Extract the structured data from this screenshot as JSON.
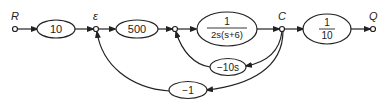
{
  "diagram": {
    "type": "signal-flow graph",
    "nodes": {
      "input": {
        "label": "R"
      },
      "error": {
        "label": "ε"
      },
      "output_c": {
        "label": "C"
      },
      "output_q": {
        "label": "Q"
      }
    },
    "blocks": {
      "gain1": {
        "label": "10"
      },
      "gain2": {
        "label": "500"
      },
      "plant": {
        "numerator": "1",
        "denominator": "2s(s+6)"
      },
      "scale": {
        "numerator": "1",
        "denominator": "10"
      },
      "inner_feedback": {
        "label": "−10s"
      },
      "outer_feedback": {
        "label": "−1"
      }
    },
    "colors": {
      "line": "#222222",
      "background": "#ffffff"
    }
  }
}
